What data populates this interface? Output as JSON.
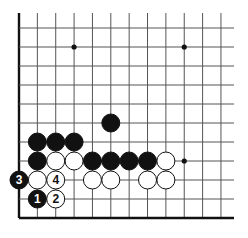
{
  "diagram": {
    "type": "go-board-fragment",
    "grid": {
      "columns": 12,
      "rows": 11,
      "x0": 19,
      "y0": 28,
      "dx": 18.36,
      "dy": 19,
      "right_extend": 234,
      "top_extend": 13,
      "left_edge": true,
      "bottom_edge": true
    },
    "colors": {
      "line": "#555555",
      "edge": "#111111",
      "black": "#111111",
      "white": "#ffffff"
    },
    "star_points": [
      {
        "col": 3,
        "row": 1
      },
      {
        "col": 9,
        "row": 1
      },
      {
        "col": 9,
        "row": 7
      }
    ],
    "stones": [
      {
        "col": 5,
        "row": 5,
        "color": "black",
        "label": ""
      },
      {
        "col": 1,
        "row": 6,
        "color": "black",
        "label": ""
      },
      {
        "col": 2,
        "row": 6,
        "color": "black",
        "label": ""
      },
      {
        "col": 3,
        "row": 6,
        "color": "black",
        "label": ""
      },
      {
        "col": 1,
        "row": 7,
        "color": "black",
        "label": ""
      },
      {
        "col": 2,
        "row": 7,
        "color": "white",
        "label": ""
      },
      {
        "col": 3,
        "row": 7,
        "color": "white",
        "label": ""
      },
      {
        "col": 4,
        "row": 7,
        "color": "black",
        "label": ""
      },
      {
        "col": 5,
        "row": 7,
        "color": "black",
        "label": ""
      },
      {
        "col": 6,
        "row": 7,
        "color": "black",
        "label": ""
      },
      {
        "col": 7,
        "row": 7,
        "color": "black",
        "label": ""
      },
      {
        "col": 8,
        "row": 7,
        "color": "white",
        "label": ""
      },
      {
        "col": 0,
        "row": 8,
        "color": "black",
        "label": "3"
      },
      {
        "col": 1,
        "row": 8,
        "color": "white",
        "label": ""
      },
      {
        "col": 2,
        "row": 8,
        "color": "white",
        "label": "4"
      },
      {
        "col": 4,
        "row": 8,
        "color": "white",
        "label": ""
      },
      {
        "col": 5,
        "row": 8,
        "color": "white",
        "label": ""
      },
      {
        "col": 7,
        "row": 8,
        "color": "white",
        "label": ""
      },
      {
        "col": 8,
        "row": 8,
        "color": "white",
        "label": ""
      },
      {
        "col": 1,
        "row": 9,
        "color": "black",
        "label": "1"
      },
      {
        "col": 2,
        "row": 9,
        "color": "white",
        "label": "2"
      }
    ]
  }
}
